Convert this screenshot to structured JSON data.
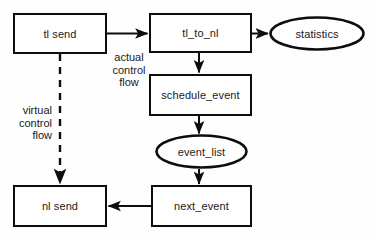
{
  "diagram": {
    "background_color": "#fefefe",
    "stroke_color": "#0d0d0d",
    "text_color": "#1a1a1a",
    "nodes": [
      {
        "id": "tl_send",
        "label": "tl send",
        "shape": "box",
        "x": 13,
        "y": 13,
        "w": 94,
        "h": 41
      },
      {
        "id": "tl_to_nl",
        "label": "tl_to_nl",
        "shape": "box",
        "x": 149,
        "y": 13,
        "w": 103,
        "h": 40
      },
      {
        "id": "statistics",
        "label": "statistics",
        "shape": "ellipse",
        "x": 269,
        "y": 16,
        "w": 96,
        "h": 35
      },
      {
        "id": "schedule_event",
        "label": "schedule_event",
        "shape": "box",
        "x": 149,
        "y": 74,
        "w": 103,
        "h": 42
      },
      {
        "id": "event_list",
        "label": "event_list",
        "shape": "ellipse",
        "x": 155,
        "y": 134,
        "w": 93,
        "h": 35
      },
      {
        "id": "nl_send",
        "label": "nl send",
        "shape": "box",
        "x": 13,
        "y": 185,
        "w": 94,
        "h": 42
      },
      {
        "id": "next_event",
        "label": "next_event",
        "shape": "box",
        "x": 151,
        "y": 185,
        "w": 101,
        "h": 42
      }
    ],
    "edge_labels": [
      {
        "id": "actual_control_flow",
        "text": "actual\ncontrol\nflow",
        "x": 101,
        "y": 51,
        "w": 56,
        "align": "center"
      },
      {
        "id": "virtual_control_flow",
        "text": "virtual\ncontrol\nflow",
        "x": 10,
        "y": 104,
        "w": 42,
        "align": "right"
      }
    ],
    "edges": [
      {
        "id": "tl_send-to-tl_to_nl",
        "from": "tl_send",
        "to": "tl_to_nl",
        "style": "solid",
        "arrow": "end"
      },
      {
        "id": "tl_to_nl-to-statistics",
        "from": "tl_to_nl",
        "to": "statistics",
        "style": "solid",
        "arrow": "end"
      },
      {
        "id": "tl_to_nl-to-schedule_event",
        "from": "tl_to_nl",
        "to": "schedule_event",
        "style": "solid",
        "arrow": "end"
      },
      {
        "id": "schedule_event-to-event_list",
        "from": "schedule_event",
        "to": "event_list",
        "style": "solid",
        "arrow": "end"
      },
      {
        "id": "event_list-to-next_event",
        "from": "event_list",
        "to": "next_event",
        "style": "solid",
        "arrow": "end"
      },
      {
        "id": "next_event-to-nl_send",
        "from": "next_event",
        "to": "nl_send",
        "style": "solid",
        "arrow": "end"
      },
      {
        "id": "tl_send-to-nl_send",
        "from": "tl_send",
        "to": "nl_send",
        "style": "dashed",
        "arrow": "end"
      }
    ]
  }
}
